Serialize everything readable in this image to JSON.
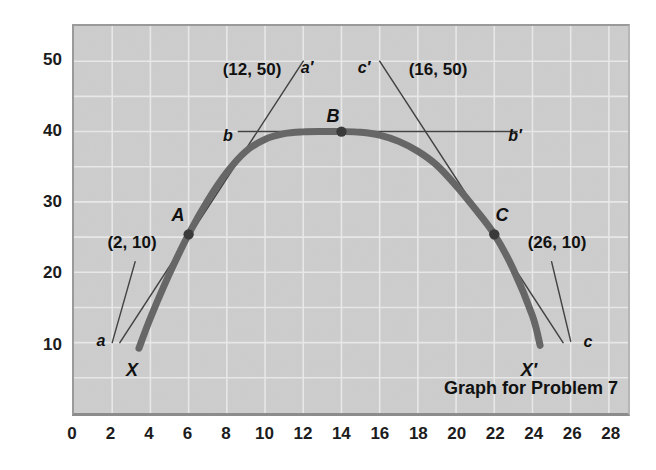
{
  "figure": {
    "caption": "Graph for Problem 7",
    "background_color": "#cdcdcd",
    "gridline_color": "#f2f2f2",
    "curve_color": "#4a4a4a",
    "line_color": "#1c1c1c",
    "text_color": "#111111"
  },
  "axes": {
    "x_ticks": [
      "0",
      "2",
      "4",
      "6",
      "8",
      "10",
      "12",
      "14",
      "16",
      "18",
      "20",
      "22",
      "24",
      "26",
      "28"
    ],
    "y_ticks": [
      "10",
      "20",
      "30",
      "40",
      "50"
    ]
  },
  "annotations": {
    "coord_a_prime": "(12, 50)",
    "coord_c_prime": "(16, 50)",
    "coord_a": "(2, 10)",
    "coord_c": "(26, 10)",
    "label_a_prime": "a′",
    "label_c_prime": "c′",
    "label_a": "a",
    "label_c": "c",
    "label_b": "b",
    "label_b_prime": "b′",
    "point_A": "A",
    "point_B": "B",
    "point_C": "C",
    "end_X": "X",
    "end_X_prime": "X′"
  },
  "chart_data": {
    "type": "line",
    "title": "Graph for Problem 7",
    "xlabel": "",
    "ylabel": "",
    "xlim": [
      0,
      29
    ],
    "ylim": [
      0,
      55
    ],
    "x_ticks": [
      0,
      2,
      4,
      6,
      8,
      10,
      12,
      14,
      16,
      18,
      20,
      22,
      24,
      26,
      28
    ],
    "y_ticks": [
      10,
      20,
      30,
      40,
      50
    ],
    "x_gridline_step": 2,
    "y_gridline_step": 5,
    "grid": true,
    "legend": "none",
    "series": [
      {
        "name": "parabola X to X'",
        "type": "curve",
        "comment": "downward parabola, vertex at B (14, 40), drawn from X to X-prime",
        "vertex": [
          14,
          40
        ],
        "x_start": 3.4,
        "x_end": 24.4,
        "points": [
          [
            3.4,
            9.2
          ],
          [
            4,
            13.5
          ],
          [
            5,
            19.8
          ],
          [
            6,
            25.4
          ],
          [
            7,
            30.2
          ],
          [
            8,
            34.2
          ],
          [
            9,
            37.2
          ],
          [
            10,
            38.9
          ],
          [
            11,
            39.7
          ],
          [
            12,
            39.95
          ],
          [
            13,
            40.0
          ],
          [
            14,
            40.0
          ],
          [
            15,
            39.9
          ],
          [
            16,
            39.5
          ],
          [
            17,
            38.6
          ],
          [
            18,
            37.2
          ],
          [
            19,
            35.2
          ],
          [
            20,
            32.3
          ],
          [
            21,
            29.0
          ],
          [
            22,
            25.4
          ],
          [
            23,
            20.4
          ],
          [
            24,
            13.8
          ],
          [
            24.4,
            9.6
          ]
        ]
      },
      {
        "name": "tangent a-a'",
        "type": "straight-line",
        "from": [
          2.4,
          10.0
        ],
        "to": [
          12.0,
          50.0
        ],
        "endpoint_labels": [
          "a",
          "a′"
        ]
      },
      {
        "name": "tangent b-b'",
        "type": "straight-line",
        "from": [
          8.6,
          40.0
        ],
        "to": [
          23.2,
          40.0
        ],
        "endpoint_labels": [
          "b",
          "b′"
        ]
      },
      {
        "name": "tangent c-c'",
        "type": "straight-line",
        "from": [
          16.0,
          50.0
        ],
        "to": [
          25.6,
          10.0
        ],
        "endpoint_labels": [
          "c′",
          "c"
        ]
      },
      {
        "name": "leader line to (2, 10)",
        "type": "leader",
        "from": [
          2.0,
          10.0
        ],
        "to": [
          3.2,
          21.5
        ]
      },
      {
        "name": "leader line to (26, 10)",
        "type": "leader",
        "from": [
          26.0,
          10.2
        ],
        "to": [
          25.0,
          21.5
        ]
      }
    ],
    "marked_points": [
      {
        "label": "A",
        "x": 6,
        "y": 25.4
      },
      {
        "label": "B",
        "x": 14,
        "y": 40.0
      },
      {
        "label": "C",
        "x": 22,
        "y": 25.4
      }
    ],
    "curve_endpoints": [
      {
        "label": "X",
        "x": 3.4,
        "y": 9.2
      },
      {
        "label": "X'",
        "x": 24.4,
        "y": 9.6
      }
    ]
  }
}
